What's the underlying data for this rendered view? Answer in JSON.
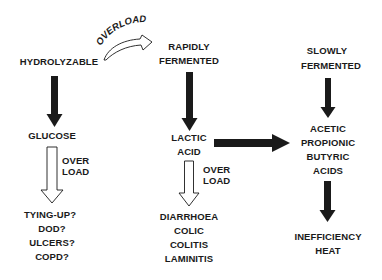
{
  "diagram": {
    "nodes": {
      "hydrolyzable": {
        "lines": [
          "HYDROLYZABLE"
        ]
      },
      "rapidly_fermented": {
        "lines": [
          "RAPIDLY",
          "FERMENTED"
        ]
      },
      "slowly_fermented": {
        "lines": [
          "SLOWLY",
          "FERMENTED"
        ]
      },
      "glucose": {
        "lines": [
          "GLUCOSE"
        ]
      },
      "lactic_acid": {
        "lines": [
          "LACTIC",
          "ACID"
        ]
      },
      "vfa": {
        "lines": [
          "ACETIC",
          "PROPIONIC",
          "BUTYRIC",
          "ACIDS"
        ]
      },
      "glucose_disorders": {
        "lines": [
          "TYING-UP?",
          "DOD?",
          "ULCERS?",
          "COPD?"
        ]
      },
      "lactic_disorders": {
        "lines": [
          "DIARRHOEA",
          "COLIC",
          "COLITIS",
          "LAMINITIS"
        ]
      },
      "vfa_outcomes": {
        "lines": [
          "INEFFICIENCY",
          "HEAT"
        ]
      }
    },
    "edge_labels": {
      "curved_overload": "OVERLOAD",
      "glucose_overload": [
        "OVER",
        "LOAD"
      ],
      "lactic_overload": [
        "OVER",
        "LOAD"
      ]
    },
    "edges": [
      {
        "from": "hydrolyzable",
        "to": "rapidly_fermented",
        "style": "curved-hollow",
        "label": "OVERLOAD"
      },
      {
        "from": "hydrolyzable",
        "to": "glucose",
        "style": "solid"
      },
      {
        "from": "rapidly_fermented",
        "to": "lactic_acid",
        "style": "solid"
      },
      {
        "from": "slowly_fermented",
        "to": "vfa",
        "style": "solid"
      },
      {
        "from": "lactic_acid",
        "to": "vfa",
        "style": "solid"
      },
      {
        "from": "glucose",
        "to": "glucose_disorders",
        "style": "hollow",
        "label": "OVER LOAD"
      },
      {
        "from": "lactic_acid",
        "to": "lactic_disorders",
        "style": "hollow",
        "label": "OVER LOAD"
      },
      {
        "from": "vfa",
        "to": "vfa_outcomes",
        "style": "solid"
      }
    ],
    "colors": {
      "ink": "#1a1a1a",
      "background": "#ffffff"
    }
  }
}
